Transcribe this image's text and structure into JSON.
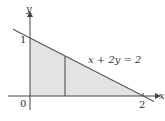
{
  "diagram": {
    "equation_label": "x + 2y = 2",
    "axes": {
      "x_label": "x",
      "y_label": "y"
    },
    "ticks": {
      "origin": "0",
      "y_intercept": "1",
      "x_intercept": "2"
    },
    "colors": {
      "fill": "#e3e3e3",
      "line": "#555555",
      "axis": "#444444",
      "text": "#333333"
    }
  }
}
